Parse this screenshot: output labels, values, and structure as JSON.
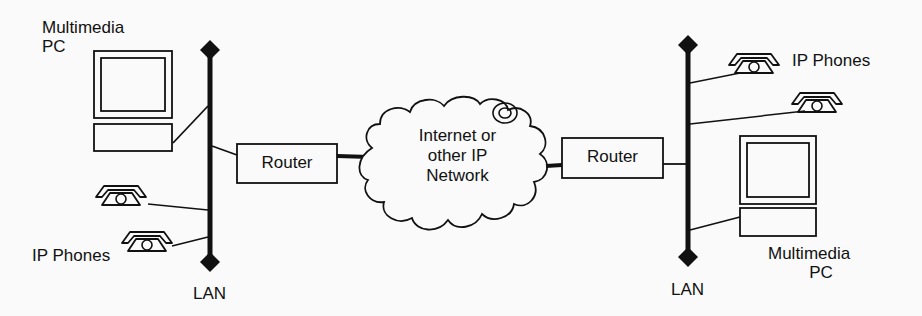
{
  "diagram": {
    "title": "",
    "colors": {
      "ink": "#111111",
      "background": "#fafafa"
    },
    "left_site": {
      "pc_label_line1": "Multimedia",
      "pc_label_line2": "PC",
      "phones_label": "IP Phones",
      "lan_label": "LAN",
      "router_label": "Router"
    },
    "network": {
      "line1": "Internet or",
      "line2": "other IP",
      "line3": "Network"
    },
    "right_site": {
      "pc_label_line1": "Multimedia",
      "pc_label_line2": "PC",
      "phones_label": "IP Phones",
      "lan_label": "LAN",
      "router_label": "Router"
    }
  }
}
